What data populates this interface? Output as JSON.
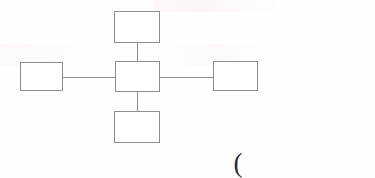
{
  "document": {
    "kind": "scanned-paper-diagram",
    "background_color": "#fefefe",
    "stroke_color": "#8d8d8d",
    "ink_color": "#2a2a2a"
  },
  "diagram": {
    "type": "block-diagram",
    "topology": "star",
    "node_label_text": "",
    "nodes": [
      {
        "id": "center",
        "label": "",
        "position": "center",
        "x": 115,
        "y": 61,
        "width": 45,
        "height": 31
      },
      {
        "id": "top",
        "label": "",
        "position": "top",
        "x": 114,
        "y": 11,
        "width": 46,
        "height": 32
      },
      {
        "id": "bottom",
        "label": "",
        "position": "bottom",
        "x": 114,
        "y": 111,
        "width": 46,
        "height": 32
      },
      {
        "id": "left",
        "label": "",
        "position": "left",
        "x": 20,
        "y": 62,
        "width": 43,
        "height": 29
      },
      {
        "id": "right",
        "label": "",
        "position": "right",
        "x": 213,
        "y": 61,
        "width": 45,
        "height": 30
      }
    ],
    "edges": [
      {
        "id": "center-top",
        "from": "center",
        "to": "top",
        "label": "",
        "orientation": "vertical"
      },
      {
        "id": "center-bottom",
        "from": "center",
        "to": "bottom",
        "label": "",
        "orientation": "vertical"
      },
      {
        "id": "center-left",
        "from": "center",
        "to": "left",
        "label": "",
        "orientation": "horizontal"
      },
      {
        "id": "center-right",
        "from": "center",
        "to": "right",
        "label": "",
        "orientation": "horizontal"
      }
    ]
  },
  "annotations": {
    "paren_mark": "("
  }
}
